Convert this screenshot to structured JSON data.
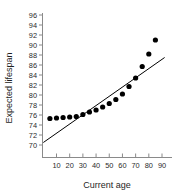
{
  "chart_data": {
    "type": "scatter",
    "title": "",
    "xlabel": "Current age",
    "ylabel": "Expected lifespan",
    "xlim": [
      0,
      94
    ],
    "ylim": [
      69,
      97
    ],
    "grid": false,
    "legend": "none",
    "x_ticks": [
      10,
      20,
      30,
      40,
      50,
      60,
      70,
      80,
      90
    ],
    "y_ticks": [
      70,
      72,
      74,
      76,
      78,
      80,
      82,
      84,
      86,
      88,
      90,
      92,
      94,
      96
    ],
    "series": [
      {
        "name": "Expected lifespan",
        "type": "scatter",
        "marker": "filled-circle",
        "color": "#000000",
        "points": [
          {
            "x": 5,
            "y": 75.3
          },
          {
            "x": 10,
            "y": 75.4
          },
          {
            "x": 15,
            "y": 75.5
          },
          {
            "x": 20,
            "y": 75.6
          },
          {
            "x": 25,
            "y": 75.7
          },
          {
            "x": 30,
            "y": 76.1
          },
          {
            "x": 35,
            "y": 76.6
          },
          {
            "x": 40,
            "y": 77.0
          },
          {
            "x": 45,
            "y": 77.6
          },
          {
            "x": 50,
            "y": 78.3
          },
          {
            "x": 55,
            "y": 79.1
          },
          {
            "x": 60,
            "y": 80.2
          },
          {
            "x": 65,
            "y": 81.7
          },
          {
            "x": 70,
            "y": 83.4
          },
          {
            "x": 75,
            "y": 85.7
          },
          {
            "x": 80,
            "y": 88.2
          },
          {
            "x": 85,
            "y": 91.0
          }
        ]
      },
      {
        "name": "Least-squares regression line",
        "type": "line",
        "color": "#000000",
        "endpoints": [
          {
            "x": 0,
            "y": 70.5
          },
          {
            "x": 92,
            "y": 87.5
          }
        ]
      }
    ]
  },
  "axes": {
    "x_axis_label": "Current age",
    "y_axis_label": "Expected lifespan"
  }
}
